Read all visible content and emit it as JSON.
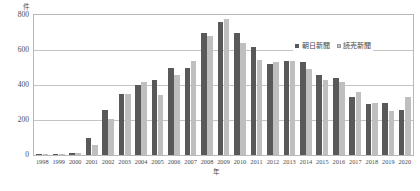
{
  "chart_data": {
    "type": "bar",
    "title": "",
    "xlabel": "年",
    "ylabel": "件",
    "ylim": [
      0,
      800
    ],
    "y_ticks": [
      0,
      200,
      400,
      600,
      800
    ],
    "grid": true,
    "legend_position": "top-right",
    "categories": [
      "1998",
      "1999",
      "2000",
      "2001",
      "2002",
      "2003",
      "2004",
      "2005",
      "2006",
      "2007",
      "2008",
      "2009",
      "2010",
      "2011",
      "2012",
      "2013",
      "2014",
      "2015",
      "2016",
      "2017",
      "2018",
      "2019",
      "2020"
    ],
    "series": [
      {
        "name": "朝日新聞",
        "color": "#595959",
        "values": [
          5,
          8,
          12,
          95,
          260,
          350,
          400,
          430,
          500,
          500,
          700,
          760,
          700,
          620,
          520,
          540,
          530,
          455,
          440,
          330,
          290,
          300,
          255
        ]
      },
      {
        "name": "読売新聞",
        "color": "#bfbfbf",
        "values": [
          4,
          6,
          10,
          55,
          205,
          350,
          420,
          345,
          460,
          540,
          680,
          780,
          640,
          545,
          530,
          535,
          490,
          430,
          420,
          360,
          295,
          250,
          330
        ]
      }
    ]
  },
  "axis": {
    "y_title": "件",
    "x_title": "年",
    "y_tick_labels": [
      "800",
      "600",
      "400",
      "200",
      "0"
    ]
  },
  "legend": {
    "items": [
      {
        "label": "朝日新聞"
      },
      {
        "label": "読売新聞"
      }
    ]
  }
}
